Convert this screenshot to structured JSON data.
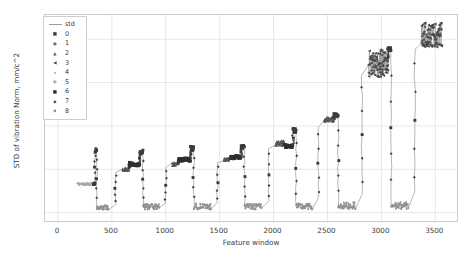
{
  "chart_data": {
    "type": "scatter",
    "title": "",
    "xlabel": "Feature window",
    "ylabel": "STD of vibration Norm, mm/c^2",
    "xlim": [
      -120,
      3720
    ],
    "ylim": [
      -0.12,
      2.28
    ],
    "xticks": [
      0,
      500,
      1000,
      1500,
      2000,
      2500,
      3000,
      3500
    ],
    "yticks": [
      0.0,
      0.5,
      1.0,
      1.5,
      2.0
    ],
    "xtick_labels": [
      "0",
      "500",
      "1000",
      "1500",
      "2000",
      "2500",
      "3000",
      "3500"
    ],
    "ytick_labels": [
      "0.0",
      "0.5",
      "1.0",
      "1.5",
      "2.0"
    ],
    "grid": true,
    "legend_position": "upper left",
    "legend_title": "",
    "line_series": {
      "name": "std",
      "color": "#9a9a9a",
      "description": "connecting line through all feature windows"
    },
    "cluster_legend": [
      {
        "label": "0",
        "marker": "square",
        "color": "#3b3b3b"
      },
      {
        "label": "1",
        "marker": "circle",
        "color": "#6e6e6e"
      },
      {
        "label": "2",
        "marker": "triangle-up",
        "color": "#555555"
      },
      {
        "label": "3",
        "marker": "triangle-left",
        "color": "#4a4a4a"
      },
      {
        "label": "4",
        "marker": "point",
        "color": "#a8a8a8"
      },
      {
        "label": "5",
        "marker": "plus",
        "color": "#8a8a8a"
      },
      {
        "label": "6",
        "marker": "square",
        "color": "#2f2f2f"
      },
      {
        "label": "7",
        "marker": "diamond",
        "color": "#454545"
      },
      {
        "label": "8",
        "marker": "circle-small",
        "color": "#8f8f8f"
      }
    ],
    "segments": [
      {
        "x0": 180,
        "x1": 330,
        "level": 0.33,
        "cluster": 4,
        "kind": "plateau",
        "jitter": 0.015
      },
      {
        "x0": 330,
        "x1": 345,
        "level": 0.33,
        "cluster": 0,
        "kind": "rise_to",
        "to": 0.72
      },
      {
        "x0": 345,
        "x1": 360,
        "level": 0.72,
        "cluster": 0,
        "kind": "spike"
      },
      {
        "x0": 360,
        "x1": 470,
        "level": 0.06,
        "cluster": 8,
        "kind": "plateau",
        "jitter": 0.03
      },
      {
        "x0": 600,
        "x1": 660,
        "level": 0.5,
        "cluster": 2,
        "kind": "plateau",
        "jitter": 0.02
      },
      {
        "x0": 660,
        "x1": 760,
        "level": 0.56,
        "cluster": 6,
        "kind": "plateau",
        "jitter": 0.02
      },
      {
        "x0": 760,
        "x1": 790,
        "level": 0.7,
        "cluster": 0,
        "kind": "spike"
      },
      {
        "x0": 790,
        "x1": 940,
        "level": 0.07,
        "cluster": 8,
        "kind": "plateau",
        "jitter": 0.035
      },
      {
        "x0": 1060,
        "x1": 1120,
        "level": 0.56,
        "cluster": 2,
        "kind": "plateau",
        "jitter": 0.02
      },
      {
        "x0": 1120,
        "x1": 1230,
        "level": 0.61,
        "cluster": 6,
        "kind": "plateau",
        "jitter": 0.02
      },
      {
        "x0": 1230,
        "x1": 1260,
        "level": 0.74,
        "cluster": 0,
        "kind": "spike"
      },
      {
        "x0": 1260,
        "x1": 1420,
        "level": 0.07,
        "cluster": 8,
        "kind": "plateau",
        "jitter": 0.035
      },
      {
        "x0": 1540,
        "x1": 1600,
        "level": 0.62,
        "cluster": 2,
        "kind": "plateau",
        "jitter": 0.02
      },
      {
        "x0": 1600,
        "x1": 1700,
        "level": 0.64,
        "cluster": 6,
        "kind": "plateau",
        "jitter": 0.02
      },
      {
        "x0": 1700,
        "x1": 1730,
        "level": 0.76,
        "cluster": 0,
        "kind": "spike"
      },
      {
        "x0": 1730,
        "x1": 1890,
        "level": 0.07,
        "cluster": 8,
        "kind": "plateau",
        "jitter": 0.035
      },
      {
        "x0": 2020,
        "x1": 2100,
        "level": 0.8,
        "cluster": 2,
        "kind": "plateau",
        "jitter": 0.03
      },
      {
        "x0": 2100,
        "x1": 2180,
        "level": 0.77,
        "cluster": 6,
        "kind": "plateau",
        "jitter": 0.02
      },
      {
        "x0": 2180,
        "x1": 2210,
        "level": 0.95,
        "cluster": 0,
        "kind": "spike"
      },
      {
        "x0": 2210,
        "x1": 2360,
        "level": 0.07,
        "cluster": 8,
        "kind": "plateau",
        "jitter": 0.035
      },
      {
        "x0": 2470,
        "x1": 2560,
        "level": 1.07,
        "cluster": 2,
        "kind": "plateau",
        "jitter": 0.03
      },
      {
        "x0": 2560,
        "x1": 2600,
        "level": 1.12,
        "cluster": 0,
        "kind": "spike"
      },
      {
        "x0": 2600,
        "x1": 2760,
        "level": 0.08,
        "cluster": 8,
        "kind": "plateau",
        "jitter": 0.04
      },
      {
        "x0": 2880,
        "x1": 3060,
        "level": 1.72,
        "cluster": 3,
        "kind": "noisy",
        "jitter": 0.16
      },
      {
        "x0": 3060,
        "x1": 3090,
        "level": 1.88,
        "cluster": 0,
        "kind": "spike"
      },
      {
        "x0": 3090,
        "x1": 3250,
        "level": 0.08,
        "cluster": 8,
        "kind": "plateau",
        "jitter": 0.04
      },
      {
        "x0": 3370,
        "x1": 3560,
        "level": 2.05,
        "cluster": 3,
        "kind": "noisy",
        "jitter": 0.14
      }
    ]
  },
  "figure": {
    "background": "#ffffff",
    "axes_background": "#ffffff",
    "grid_color": "#dcdcdc",
    "frame_color": "#c9c9c9",
    "tick_text_color": "#3a3a3a"
  }
}
